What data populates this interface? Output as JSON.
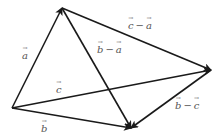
{
  "diagram": {
    "title": "",
    "stroke_color": "#1a1a1a",
    "label_color": "#555555",
    "points": {
      "O": {
        "x": 12,
        "y": 108
      },
      "A": {
        "x": 62,
        "y": 8
      },
      "B": {
        "x": 131,
        "y": 128
      },
      "C": {
        "x": 211,
        "y": 70
      }
    },
    "vectors": [
      {
        "id": "a",
        "from": "O",
        "to": "A",
        "label": "a"
      },
      {
        "id": "b",
        "from": "O",
        "to": "B",
        "label": "b"
      },
      {
        "id": "c",
        "from": "O",
        "to": "C",
        "label": "c"
      },
      {
        "id": "c_minus_a",
        "from": "A",
        "to": "C",
        "label": "c − a"
      },
      {
        "id": "b_minus_a",
        "from": "A",
        "to": "B",
        "label": "b − a"
      },
      {
        "id": "b_minus_c",
        "from": "C",
        "to": "B",
        "label": "b − c"
      }
    ],
    "labels": {
      "a": {
        "sym1": "a"
      },
      "b": {
        "sym1": "b"
      },
      "c": {
        "sym1": "c"
      },
      "c_minus_a": {
        "sym1": "c",
        "op": "−",
        "sym2": "a"
      },
      "b_minus_a": {
        "sym1": "b",
        "op": "−",
        "sym2": "a"
      },
      "b_minus_c": {
        "sym1": "b",
        "op": "−",
        "sym2": "c"
      }
    }
  }
}
